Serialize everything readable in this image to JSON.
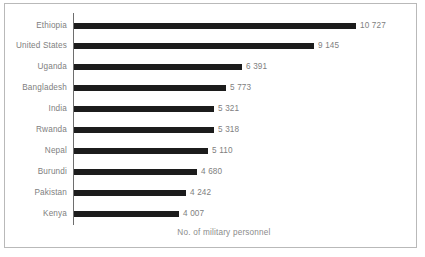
{
  "chart_data": {
    "type": "bar",
    "orientation": "horizontal",
    "title": "",
    "xlabel": "No. of military personnel",
    "ylabel": "",
    "grid": false,
    "legend": null,
    "xlim": [
      0,
      10727
    ],
    "value_separator": "space",
    "categories": [
      "Ethiopia",
      "United States",
      "Uganda",
      "Bangladesh",
      "India",
      "Rwanda",
      "Nepal",
      "Burundi",
      "Pakistan",
      "Kenya"
    ],
    "values": [
      10727,
      9145,
      6391,
      5773,
      5321,
      5318,
      5110,
      4680,
      4242,
      4007
    ],
    "value_labels": [
      "10 727",
      "9 145",
      "6 391",
      "5 773",
      "5 321",
      "5 318",
      "5 110",
      "4 680",
      "4 242",
      "4 007"
    ],
    "colors": {
      "bar": "#1c1c1c",
      "text": "#808080",
      "axis_line": "#6e6e6e",
      "frame": "#b9b9b9",
      "background": "#ffffff"
    }
  }
}
